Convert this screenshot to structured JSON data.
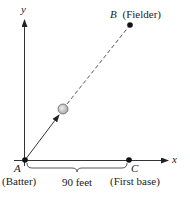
{
  "diagram": {
    "axes": {
      "x_label": "x",
      "y_label": "y"
    },
    "points": {
      "A": {
        "letter": "A",
        "caption": "(Batter)"
      },
      "B": {
        "letter": "B",
        "caption": "(Fielder)"
      },
      "C": {
        "letter": "C",
        "caption": "(First base)"
      }
    },
    "distance_label": "90 feet",
    "colors": {
      "line": "#222222",
      "ball": "#cccccc",
      "background": "#ffffff"
    }
  }
}
